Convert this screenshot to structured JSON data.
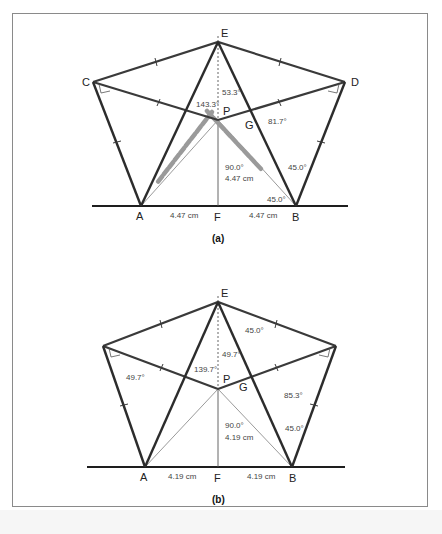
{
  "figures": [
    {
      "id": "a",
      "caption": "(a)",
      "points": {
        "E": "E",
        "C": "C",
        "D": "D",
        "P": "P",
        "G": "G",
        "A": "A",
        "F": "F",
        "B": "B"
      },
      "measurements": {
        "angle_EPtop": "53.3°",
        "angle_CP": "143.3°",
        "angle_G": "81.7°",
        "angle_PF": "90.0°",
        "length_PF": "4.47 cm",
        "angle_B_upper": "45.0°",
        "angle_B_lower": "45.0°",
        "length_AF": "4.47 cm",
        "length_FB": "4.47 cm"
      }
    },
    {
      "id": "b",
      "caption": "(b)",
      "points": {
        "E": "E",
        "P": "P",
        "G": "G",
        "A": "A",
        "F": "F",
        "B": "B"
      },
      "measurements": {
        "angle_ED": "45.0°",
        "angle_EPtop": "49.7°",
        "angle_CP": "139.7°",
        "angle_C": "49.7°",
        "angle_G": "85.3°",
        "angle_PF": "90.0°",
        "length_PF": "4.19 cm",
        "angle_B": "45.0°",
        "length_AF": "4.19 cm",
        "length_FB": "4.19 cm"
      }
    }
  ],
  "colors": {
    "thick_line": "#3a3a3a",
    "thin_line": "#555555",
    "dashed_highlight": "#9a9a9a",
    "frame": "#8a8a8a"
  }
}
